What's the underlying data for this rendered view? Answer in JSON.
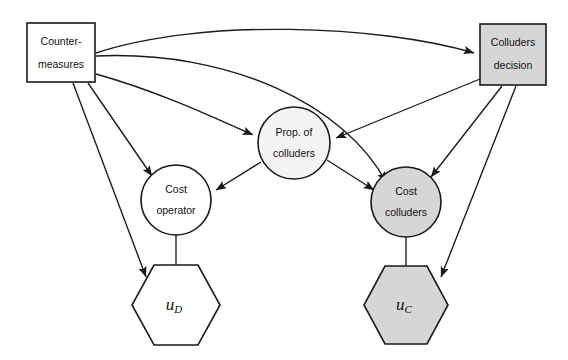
{
  "figure": {
    "kind": "influence-diagram",
    "background_color": "#ffffff",
    "stroke_color": "#1a1a1a"
  },
  "legend_colors": {
    "decision_operator_fill": "#ffffff",
    "decision_colluder_fill": "#d6d6d6",
    "chance_operator_fill": "#ffffff",
    "chance_shared_fill": "#f4f4f4",
    "chance_colluder_fill": "#d6d6d6",
    "utility_operator_fill": "#ffffff",
    "utility_colluder_fill": "#d6d6d6"
  },
  "nodes": [
    {
      "id": "countermeasures",
      "shape": "rectangle",
      "role": "decision",
      "fill": "#ffffff",
      "line1": "Counter-",
      "line2": "measures",
      "x": 27,
      "y": 23,
      "width": 68,
      "height": 59
    },
    {
      "id": "colluders-decision",
      "shape": "rectangle",
      "role": "decision",
      "fill": "#d6d6d6",
      "line1": "Colluders",
      "line2": "decision",
      "x": 480,
      "y": 24,
      "width": 66,
      "height": 61
    },
    {
      "id": "prop-of-colluders",
      "shape": "circle",
      "role": "chance",
      "fill": "#f4f4f4",
      "line1": "Prop.  of",
      "line2": "colluders",
      "cx": 294,
      "cy": 143,
      "r": 36
    },
    {
      "id": "cost-operator",
      "shape": "circle",
      "role": "chance",
      "fill": "#ffffff",
      "line1": "Cost",
      "line2": "operator",
      "cx": 176,
      "cy": 200,
      "r": 35
    },
    {
      "id": "cost-colluders",
      "shape": "circle",
      "role": "chance",
      "fill": "#d6d6d6",
      "line1": "Cost",
      "line2": "colluders",
      "cx": 406,
      "cy": 202,
      "r": 35
    },
    {
      "id": "u-d",
      "shape": "hexagon",
      "role": "utility",
      "fill": "#ffffff",
      "base": "u",
      "subscript": "D",
      "cx": 176,
      "cy": 305,
      "rx": 44,
      "ry": 40
    },
    {
      "id": "u-c",
      "shape": "hexagon",
      "role": "utility",
      "fill": "#d6d6d6",
      "base": "u",
      "subscript": "C",
      "cx": 406,
      "cy": 305,
      "rx": 42,
      "ry": 39
    }
  ],
  "edges": [
    {
      "id": "e1",
      "from": "countermeasures",
      "to": "colluders-decision",
      "style": "curved"
    },
    {
      "id": "e2",
      "from": "countermeasures",
      "to": "cost-colluders",
      "style": "curved"
    },
    {
      "id": "e3",
      "from": "countermeasures",
      "to": "prop-of-colluders",
      "style": "curved"
    },
    {
      "id": "e4",
      "from": "countermeasures",
      "to": "cost-operator",
      "style": "straight"
    },
    {
      "id": "e5",
      "from": "countermeasures",
      "to": "u-d",
      "style": "straight"
    },
    {
      "id": "e6",
      "from": "colluders-decision",
      "to": "prop-of-colluders",
      "style": "straight"
    },
    {
      "id": "e7",
      "from": "colluders-decision",
      "to": "cost-colluders",
      "style": "straight"
    },
    {
      "id": "e8",
      "from": "colluders-decision",
      "to": "u-c",
      "style": "straight"
    },
    {
      "id": "e9",
      "from": "prop-of-colluders",
      "to": "cost-operator",
      "style": "straight"
    },
    {
      "id": "e10",
      "from": "prop-of-colluders",
      "to": "cost-colluders",
      "style": "straight"
    },
    {
      "id": "e11",
      "from": "cost-operator",
      "to": "u-d",
      "style": "straight"
    },
    {
      "id": "e12",
      "from": "cost-colluders",
      "to": "u-c",
      "style": "straight"
    }
  ]
}
